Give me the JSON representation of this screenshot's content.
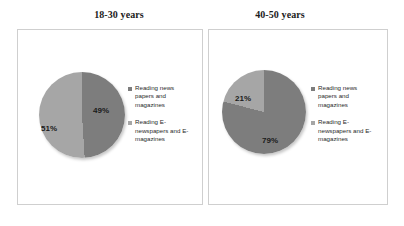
{
  "charts": [
    {
      "title": "18-30 years",
      "slices": [
        {
          "label": "Reading news papers and magazines",
          "value": 49,
          "display": "49%",
          "color": "#7d7d7d"
        },
        {
          "label": "Reading E-newspapers and E-magazines",
          "value": 51,
          "display": "51%",
          "color": "#a6a6a6"
        }
      ]
    },
    {
      "title": "40-50 years",
      "slices": [
        {
          "label": "Reading news papers and magazines",
          "value": 79,
          "display": "79%",
          "color": "#7d7d7d"
        },
        {
          "label": "Reading E-newspapers and E-magazines",
          "value": 21,
          "display": "21%",
          "color": "#a6a6a6"
        }
      ]
    }
  ],
  "chart_data": [
    {
      "type": "pie",
      "title": "18-30 years",
      "categories": [
        "Reading news papers and magazines",
        "Reading E-newspapers and E-magazines"
      ],
      "values": [
        49,
        51
      ],
      "data_labels": [
        "49%",
        "51%"
      ],
      "colors": [
        "#7d7d7d",
        "#a6a6a6"
      ],
      "legend_position": "right",
      "start_angle_deg": 0,
      "direction": "clockwise",
      "xlabel": "",
      "ylabel": ""
    },
    {
      "type": "pie",
      "title": "40-50 years",
      "categories": [
        "Reading news papers and magazines",
        "Reading E-newspapers and E-magazines"
      ],
      "values": [
        79,
        21
      ],
      "data_labels": [
        "79%",
        "21%"
      ],
      "colors": [
        "#7d7d7d",
        "#a6a6a6"
      ],
      "legend_position": "right",
      "start_angle_deg": 0,
      "direction": "clockwise",
      "xlabel": "",
      "ylabel": ""
    }
  ],
  "legend": {
    "items": [
      {
        "label": "Reading news papers and magazines",
        "color": "#7d7d7d"
      },
      {
        "label": "Reading E-newspapers and E-magazines",
        "color": "#a6a6a6"
      }
    ]
  },
  "style": {
    "panel_border": "#cfcfcf",
    "background": "#ffffff",
    "text": "#1b1b1b"
  }
}
